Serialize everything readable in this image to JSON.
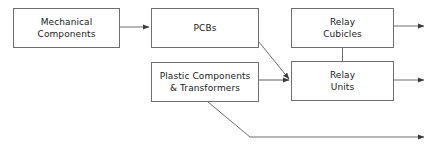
{
  "diagram": {
    "type": "flowchart",
    "title": "",
    "background_color": "#ffffff",
    "box_border_color": "#6e6e6e",
    "connector_color": "#6e6e6e",
    "text_color": "#1a1a1a",
    "nodes": [
      {
        "id": "mechanical-components",
        "line1": "Mechanical",
        "line2": "Components",
        "x": 13,
        "y": 8,
        "w": 107,
        "h": 40
      },
      {
        "id": "pcbs",
        "line1": "PCBs",
        "line2": "",
        "x": 151,
        "y": 8,
        "w": 108,
        "h": 40
      },
      {
        "id": "relay-cubicles",
        "line1": "Relay",
        "line2": "Cubicles",
        "x": 291,
        "y": 8,
        "w": 103,
        "h": 40
      },
      {
        "id": "plastic-components-transformers",
        "line1": "Plastic Components",
        "line2": "& Transformers",
        "x": 151,
        "y": 62,
        "w": 108,
        "h": 40
      },
      {
        "id": "relay-units",
        "line1": "Relay",
        "line2": "Units",
        "x": 291,
        "y": 61,
        "w": 103,
        "h": 40
      }
    ],
    "connectors": [
      {
        "id": "mechanical-to-pcbs",
        "from": "mechanical-components",
        "to": "pcbs",
        "arrowhead": true
      },
      {
        "id": "pcbs-to-relay-units",
        "from": "pcbs",
        "to": "relay-units",
        "arrowhead": true
      },
      {
        "id": "plastic-to-relay-units",
        "from": "plastic-components-transformers",
        "to": "relay-units",
        "arrowhead": true
      },
      {
        "id": "relay-cubicles-to-relay-units",
        "from": "relay-cubicles",
        "to": "relay-units",
        "arrowhead": false
      },
      {
        "id": "relay-cubicles-output",
        "from": "relay-cubicles",
        "to": "",
        "arrowhead": true
      },
      {
        "id": "relay-units-output",
        "from": "relay-units",
        "to": "",
        "arrowhead": true
      },
      {
        "id": "plastic-bypass-output",
        "from": "plastic-components-transformers",
        "to": "",
        "arrowhead": true
      }
    ]
  }
}
